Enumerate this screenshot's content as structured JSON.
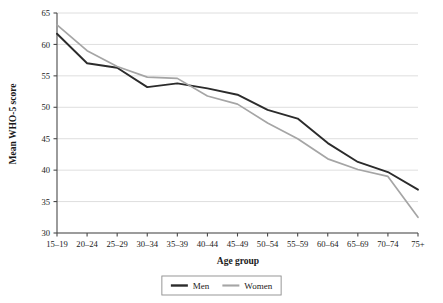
{
  "chart_data": {
    "type": "line",
    "title": "",
    "xlabel": "Age group",
    "ylabel": "Mean WHO-5 score",
    "categories": [
      "15–19",
      "20–24",
      "25–29",
      "30–34",
      "35–39",
      "40–44",
      "45–49",
      "50–54",
      "55–59",
      "60–64",
      "65–69",
      "70–74",
      "75+"
    ],
    "series": [
      {
        "name": "Men",
        "color": "#2b2b2b",
        "values": [
          61.7,
          57.0,
          56.3,
          53.2,
          53.8,
          53.0,
          52.0,
          49.6,
          48.2,
          44.3,
          41.3,
          39.7,
          36.9
        ]
      },
      {
        "name": "Women",
        "color": "#a5a5a5",
        "values": [
          63.1,
          59.0,
          56.5,
          54.8,
          54.6,
          51.8,
          50.5,
          47.5,
          45.0,
          41.8,
          40.1,
          39.0,
          32.5
        ]
      }
    ],
    "ylim": [
      30,
      65
    ],
    "yticks": [
      30,
      35,
      40,
      45,
      50,
      55,
      60,
      65
    ],
    "ytick_labels": [
      "30",
      "35",
      "40",
      "45",
      "50",
      "55",
      "60",
      "65"
    ],
    "grid": true,
    "grid_axis": "y",
    "legend_position": "bottom"
  },
  "legend": {
    "entries": [
      {
        "label": "Men",
        "color": "#2b2b2b"
      },
      {
        "label": "Women",
        "color": "#a5a5a5"
      }
    ]
  }
}
